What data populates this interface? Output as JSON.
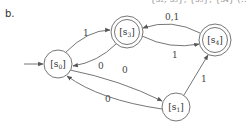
{
  "figure": {
    "label": "b.",
    "top_fragment": "{s₂, s₃}, {s₃}, {s₄} (…"
  },
  "diagram": {
    "type": "finite-state-automaton",
    "start_state": "s0",
    "nodes": [
      {
        "id": "s0",
        "label": "[s",
        "sub": "0",
        "close": "]",
        "accepting": false,
        "cx": 58,
        "cy": 64
      },
      {
        "id": "s3",
        "label": "[s",
        "sub": "3",
        "close": "]",
        "accepting": true,
        "cx": 127,
        "cy": 32
      },
      {
        "id": "s4",
        "label": "[s",
        "sub": "4",
        "close": "]",
        "accepting": true,
        "cx": 215,
        "cy": 40
      },
      {
        "id": "s1",
        "label": "[s",
        "sub": "1",
        "close": "]",
        "accepting": false,
        "cx": 176,
        "cy": 107
      }
    ],
    "edges": [
      {
        "from": "s0",
        "to": "s3",
        "label": "1"
      },
      {
        "from": "s3",
        "to": "s0",
        "label": "0"
      },
      {
        "from": "s3",
        "to": "s4",
        "label": "1"
      },
      {
        "from": "s4",
        "to": "s3",
        "label": "0,1"
      },
      {
        "from": "s0",
        "to": "s1",
        "label": "0"
      },
      {
        "from": "s1",
        "to": "s0",
        "label": "0"
      },
      {
        "from": "s1",
        "to": "s4",
        "label": "1"
      }
    ]
  }
}
